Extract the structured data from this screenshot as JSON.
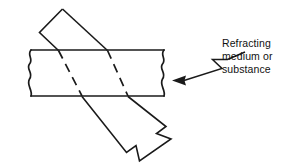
{
  "figure": {
    "background_color": "#ffffff",
    "line_color": "#1a1a1a",
    "width": 284,
    "height": 166
  },
  "annotation": {
    "lines": [
      "Refracting",
      "medium or",
      "substance"
    ],
    "text_color": "#111111",
    "leader": {
      "style": "zigzag",
      "arrow_direction": "left",
      "points": "244,52 228,60 214,60 222,68 200,78"
    }
  },
  "slab": {
    "label": "refracting-medium-slab",
    "top_y": 50,
    "bottom_y": 96,
    "left_x": 29,
    "right_x": 166,
    "edge_style": "torn-wavy",
    "top_edge_path": "M 31,50 L 164,50",
    "bottom_edge_path": "M 31,96 L 164,96",
    "left_edge_path": "M 31,50 C 27,56 34,60 30,65 C 26,70 34,74 30,80 C 27,86 33,90 31,96",
    "right_edge_path": "M 164,50 C 160,56 167,60 163,65 C 159,70 167,74 163,80 C 160,86 166,90 164,96"
  },
  "beam": {
    "label": "light-beam",
    "description": "Wide block arrow entering top-left, refracting through slab, exiting bottom-right",
    "incident_outline": "M 62,9 L 40,32 L 82,96 L 128,96 Z",
    "entry_left_x": 58,
    "entry_right_x": 107,
    "exit_left_x": 82,
    "exit_right_x": 128,
    "internal_dashed_left": "M 58,50 L 82,96",
    "internal_dashed_right": "M 107,50 L 128,96",
    "emergent_outline": "M 82,96 L 127,152 L 137,146 L 140,161 L 171,139 L 157,134 L 166,126 L 128,96",
    "arrow_tip": [
      171,
      139
    ]
  },
  "elements": {
    "incident_ray_name": "incident-ray-arrow",
    "refracted_ray_name": "refracted-ray-dashed",
    "emergent_ray_name": "emergent-ray-arrow",
    "slab_name": "refracting-medium-slab",
    "callout_name": "refracting-medium-callout"
  }
}
